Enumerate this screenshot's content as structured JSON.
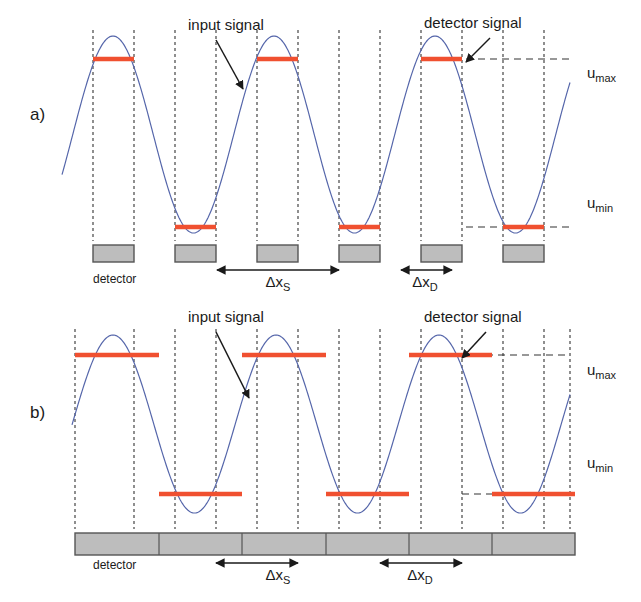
{
  "figure": {
    "background_color": "#ffffff",
    "signal_color": "#5566aa",
    "detector_bar_color": "#f05030",
    "detector_block_fill": "#bdbdbd",
    "detector_block_stroke": "#555555",
    "dash_color": "#333333",
    "text_color": "#1a1a1a"
  },
  "panels": [
    {
      "id": "a",
      "label": "a)",
      "label_x": 30,
      "label_y": 120,
      "annotations": {
        "input_signal": {
          "text": "input signal",
          "text_x": 188,
          "text_y": 30,
          "arrow_from": [
            216,
            40
          ],
          "arrow_to": [
            243,
            89
          ]
        },
        "detector_signal": {
          "text": "detector signal",
          "text_x": 424,
          "text_y": 28,
          "arrow_from": [
            490,
            38
          ],
          "arrow_to": [
            466,
            62
          ]
        }
      },
      "axis_labels": [
        {
          "base": "u",
          "sub": "max",
          "x": 587,
          "y": 78
        },
        {
          "base": "u",
          "sub": "min",
          "x": 587,
          "y": 208
        }
      ],
      "detector_caption": {
        "text": "detector",
        "x": 93,
        "y": 283
      },
      "deltas": [
        {
          "base": "Δx",
          "sub": "S",
          "x": 278,
          "y": 287,
          "arrow_x1": 217,
          "arrow_x2": 339,
          "arrow_y": 270
        },
        {
          "base": "Δx",
          "sub": "D",
          "x": 425,
          "y": 287,
          "arrow_x1": 401,
          "arrow_x2": 452,
          "arrow_y": 270
        }
      ],
      "level_lines": {
        "u_max_y": 59,
        "u_min_y": 227,
        "dash_x1": 466,
        "dash_x2": 570
      },
      "wave": {
        "y_top": 36,
        "y_bottom": 233,
        "x_start": 62,
        "x_end": 570,
        "period": 161,
        "phase_x": 113
      },
      "dashed_verticals": [
        93,
        134,
        175,
        216,
        257,
        298,
        339,
        380,
        421,
        462,
        503,
        544
      ],
      "red_bars": [
        {
          "x1": 93,
          "x2": 134,
          "y": 59
        },
        {
          "x1": 175,
          "x2": 216,
          "y": 227
        },
        {
          "x1": 257,
          "x2": 298,
          "y": 59
        },
        {
          "x1": 339,
          "x2": 380,
          "y": 227
        },
        {
          "x1": 421,
          "x2": 462,
          "y": 59
        },
        {
          "x1": 503,
          "x2": 544,
          "y": 227
        }
      ],
      "detector_blocks": [
        {
          "x": 93,
          "y": 245,
          "w": 41,
          "h": 17
        },
        {
          "x": 175,
          "y": 245,
          "w": 41,
          "h": 17
        },
        {
          "x": 257,
          "y": 245,
          "w": 41,
          "h": 17
        },
        {
          "x": 339,
          "y": 245,
          "w": 41,
          "h": 17
        },
        {
          "x": 421,
          "y": 245,
          "w": 41,
          "h": 17
        },
        {
          "x": 503,
          "y": 245,
          "w": 41,
          "h": 17
        }
      ]
    },
    {
      "id": "b",
      "label": "b)",
      "label_x": 30,
      "label_y": 418,
      "annotations": {
        "input_signal": {
          "text": "input signal",
          "text_x": 188,
          "text_y": 322,
          "arrow_from": [
            216,
            332
          ],
          "arrow_to": [
            249,
            398
          ]
        },
        "detector_signal": {
          "text": "detector signal",
          "text_x": 424,
          "text_y": 322,
          "arrow_from": [
            486,
            332
          ],
          "arrow_to": [
            462,
            358
          ]
        }
      },
      "axis_labels": [
        {
          "base": "u",
          "sub": "max",
          "x": 587,
          "y": 375
        },
        {
          "base": "u",
          "sub": "min",
          "x": 587,
          "y": 468
        }
      ],
      "detector_caption": {
        "text": "detector",
        "x": 93,
        "y": 569
      },
      "deltas": [
        {
          "base": "Δx",
          "sub": "S",
          "x": 278,
          "y": 580,
          "arrow_x1": 216,
          "arrow_x2": 298,
          "arrow_y": 563
        },
        {
          "base": "Δx",
          "sub": "D",
          "x": 420,
          "y": 580,
          "arrow_x1": 380,
          "arrow_x2": 462,
          "arrow_y": 563
        }
      ],
      "level_lines": {
        "u_max_y": 355,
        "u_min_y": 494,
        "dash_x1": 462,
        "dash_x2": 570
      },
      "wave": {
        "y_top": 335,
        "y_bottom": 513,
        "x_start": 72,
        "x_end": 570,
        "period": 163,
        "phase_x": 113
      },
      "dashed_verticals": [
        75,
        134,
        175,
        216,
        257,
        298,
        339,
        380,
        421,
        462,
        503,
        544,
        570
      ],
      "red_bars": [
        {
          "x1": 75,
          "x2": 159,
          "y": 355
        },
        {
          "x1": 159,
          "x2": 242,
          "y": 494
        },
        {
          "x1": 242,
          "x2": 326,
          "y": 355
        },
        {
          "x1": 326,
          "x2": 409,
          "y": 494
        },
        {
          "x1": 409,
          "x2": 492,
          "y": 355
        },
        {
          "x1": 492,
          "x2": 575,
          "y": 494
        }
      ],
      "detector_bar": {
        "x": 75,
        "y": 533,
        "w": 500,
        "h": 22,
        "dividers": [
          159,
          242,
          326,
          409,
          492
        ]
      }
    }
  ]
}
